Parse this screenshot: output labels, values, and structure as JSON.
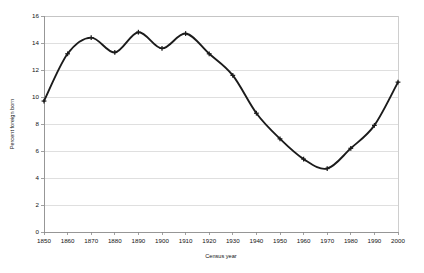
{
  "chart_data": {
    "type": "line",
    "title": "",
    "subtitle": "",
    "xlabel": "Census year",
    "ylabel": "Percent foreign born",
    "xlim": [
      1850,
      2000
    ],
    "ylim": [
      0,
      16
    ],
    "grid": true,
    "legend": "none",
    "x_ticks": [
      1850,
      1860,
      1870,
      1880,
      1890,
      1900,
      1910,
      1920,
      1930,
      1940,
      1950,
      1960,
      1970,
      1980,
      1990,
      2000
    ],
    "x_tick_labels": [
      "1850",
      "1860",
      "1870",
      "1880",
      "1890",
      "1900",
      "1910",
      "1920",
      "1930",
      "1940",
      "1950",
      "1960",
      "1970",
      "1980",
      "1990",
      "2000"
    ],
    "y_ticks": [
      0,
      2,
      4,
      6,
      8,
      10,
      12,
      14,
      16
    ],
    "y_tick_labels": [
      "0",
      "2",
      "4",
      "6",
      "8",
      "10",
      "12",
      "14",
      "16"
    ],
    "series": [
      {
        "name": "Percent foreign born",
        "color": "#1b1b1b",
        "marker": "plus",
        "x": [
          1850,
          1860,
          1870,
          1880,
          1890,
          1900,
          1910,
          1920,
          1930,
          1940,
          1950,
          1960,
          1970,
          1980,
          1990,
          2000
        ],
        "values": [
          9.7,
          13.2,
          14.4,
          13.3,
          14.8,
          13.6,
          14.7,
          13.2,
          11.6,
          8.8,
          6.9,
          5.4,
          4.7,
          6.2,
          7.9,
          11.1
        ]
      }
    ],
    "annotations": []
  },
  "axis": {
    "y_title": "Percent foreign born",
    "x_title": "Census year"
  }
}
